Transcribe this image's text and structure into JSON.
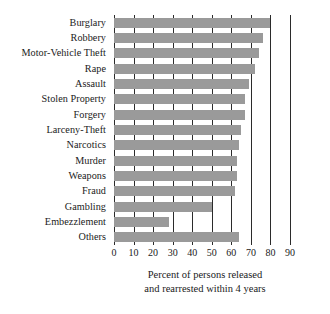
{
  "chart_data": {
    "type": "bar",
    "orientation": "horizontal",
    "title": "",
    "subtitle": "",
    "xlabel": "Percent of persons released and rearrested within 4 years",
    "xlabel_lines": [
      "Percent of persons released",
      "and rearrested within 4 years"
    ],
    "ylabel": "",
    "categories": [
      "Burglary",
      "Robbery",
      "Motor-Vehicle Theft",
      "Rape",
      "Assault",
      "Stolen Property",
      "Forgery",
      "Larceny-Theft",
      "Narcotics",
      "Murder",
      "Weapons",
      "Fraud",
      "Gambling",
      "Embezzlement",
      "Others"
    ],
    "values": [
      80,
      76,
      74,
      72,
      69,
      67,
      67,
      65,
      64,
      63,
      63,
      62,
      50,
      28,
      64
    ],
    "xlim": [
      0,
      90
    ],
    "xticks": [
      0,
      10,
      20,
      30,
      40,
      50,
      60,
      70,
      80,
      90
    ],
    "xtick_labels": [
      "0",
      "10",
      "20",
      "30",
      "40",
      "50",
      "60",
      "70",
      "80",
      "90"
    ],
    "grid": true,
    "grid_axis": "x",
    "legend": false,
    "bar_color": "#9a9a9a",
    "grid_color": "#2b2b2b",
    "background": "#ffffff"
  }
}
